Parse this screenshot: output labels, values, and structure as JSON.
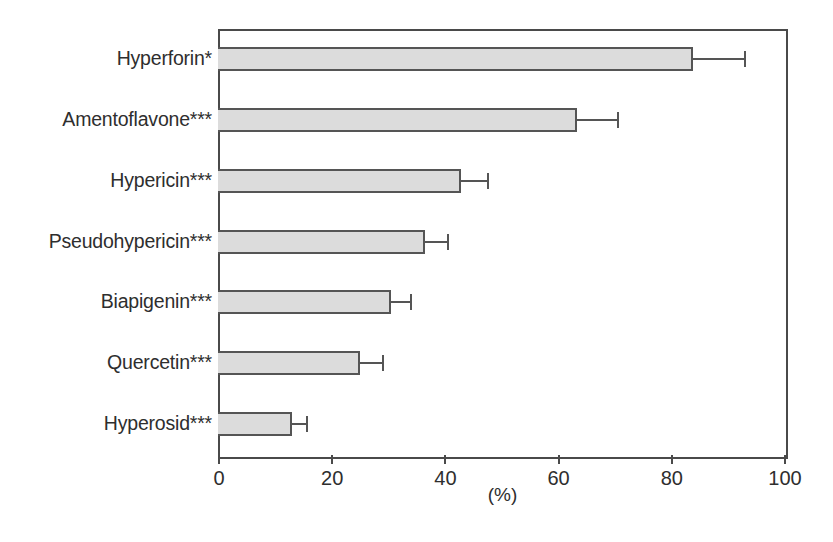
{
  "chart_data": {
    "type": "bar",
    "orientation": "horizontal",
    "title": "",
    "subtitle": "",
    "xlabel": "(%)",
    "ylabel": "",
    "xlim": [
      0,
      100
    ],
    "xticks": [
      0,
      20,
      40,
      60,
      80,
      100
    ],
    "xticklabels": [
      "0",
      "20",
      "40",
      "60",
      "80",
      "100"
    ],
    "grid": false,
    "legend": null,
    "bar_fill_color": "#dcdcdc",
    "bar_edge_color": "#555555",
    "axis_color": "#4a4a4a",
    "text_color": "#2e2e2e",
    "categories": [
      "Hyperforin*",
      "Amentoflavone***",
      "Hypericin***",
      "Pseudohypericin***",
      "Biapigenin***",
      "Quercetin***",
      "Hyperosid***"
    ],
    "values": [
      84,
      63.5,
      43,
      36.5,
      30.5,
      25,
      13
    ],
    "errors_upper": [
      9,
      7,
      4.5,
      4,
      3.5,
      4,
      2.5
    ],
    "error_cap_values": [
      93,
      70.5,
      47.5,
      40.5,
      34,
      29,
      15.5
    ],
    "series": [
      {
        "name": "percent",
        "values": [
          84,
          63.5,
          43,
          36.5,
          30.5,
          25,
          13
        ]
      }
    ],
    "points": [
      {
        "category": "Hyperforin*",
        "value": 84,
        "error_upper": 9,
        "significance": "*"
      },
      {
        "category": "Amentoflavone***",
        "value": 63.5,
        "error_upper": 7,
        "significance": "***"
      },
      {
        "category": "Hypericin***",
        "value": 43,
        "error_upper": 4.5,
        "significance": "***"
      },
      {
        "category": "Pseudohypericin***",
        "value": 36.5,
        "error_upper": 4,
        "significance": "***"
      },
      {
        "category": "Biapigenin***",
        "value": 30.5,
        "error_upper": 3.5,
        "significance": "***"
      },
      {
        "category": "Quercetin***",
        "value": 25,
        "error_upper": 4,
        "significance": "***"
      },
      {
        "category": "Hyperosid***",
        "value": 13,
        "error_upper": 2.5,
        "significance": "***"
      }
    ]
  }
}
